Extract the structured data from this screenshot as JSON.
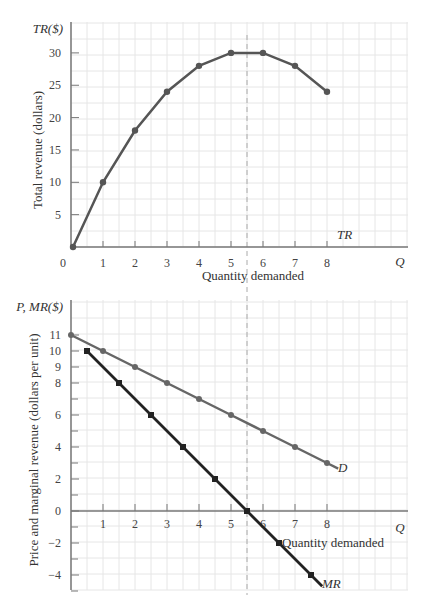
{
  "chart_data": [
    {
      "type": "line",
      "title": "",
      "ylabel": "Total revenue (dollars)",
      "y_axis_symbol": "TR($)",
      "xlabel": "Quantity demanded",
      "x_axis_symbol": "Q",
      "x": [
        0,
        1,
        2,
        3,
        4,
        5,
        6,
        7,
        8
      ],
      "series": [
        {
          "name": "TR",
          "values": [
            0,
            10,
            18,
            24,
            28,
            30,
            30,
            28,
            24
          ]
        }
      ],
      "x_ticks": [
        "0",
        "1",
        "2",
        "3",
        "4",
        "5",
        "6",
        "7",
        "8"
      ],
      "y_ticks": [
        "5",
        "10",
        "15",
        "20",
        "25",
        "30"
      ],
      "ylim": [
        0,
        34
      ],
      "xlim": [
        0,
        11
      ],
      "grid": true,
      "annotations": [
        {
          "type": "vertical-dashed-line",
          "x": 5.5
        }
      ]
    },
    {
      "type": "line",
      "title": "",
      "ylabel": "Price and marginal revenue (dollars per unit)",
      "y_axis_symbol": "P, MR($)",
      "xlabel": "Quantity demanded",
      "x_axis_symbol": "Q",
      "series": [
        {
          "name": "D",
          "x": [
            0,
            1,
            2,
            3,
            4,
            5,
            6,
            7,
            8
          ],
          "values": [
            11,
            10,
            9,
            8,
            7,
            6,
            5,
            4,
            3
          ]
        },
        {
          "name": "MR",
          "x": [
            0.5,
            1.5,
            2.5,
            3.5,
            4.5,
            5.5,
            6.5,
            7.5
          ],
          "values": [
            10,
            8,
            6,
            4,
            2,
            0,
            -2,
            -4
          ]
        }
      ],
      "x_ticks": [
        "1",
        "2",
        "3",
        "4",
        "5",
        "6",
        "7",
        "8"
      ],
      "y_ticks": [
        "11",
        "10",
        "9",
        "8",
        "6",
        "4",
        "2",
        "0",
        "-2",
        "-4"
      ],
      "ylim": [
        -5,
        13
      ],
      "xlim": [
        0,
        11
      ],
      "grid": true,
      "annotations": [
        {
          "type": "vertical-dashed-line",
          "x": 5.5
        }
      ]
    }
  ],
  "labels": {
    "top": {
      "y_symbol": "TR($)",
      "y_title": "Total revenue (dollars)",
      "x_title": "Quantity demanded",
      "x_symbol": "Q",
      "curve": "TR"
    },
    "bottom": {
      "y_symbol": "P, MR($)",
      "y_title": "Price and marginal revenue (dollars per unit)",
      "x_title": "Quantity demanded",
      "x_symbol": "Q",
      "curve_d": "D",
      "curve_mr": "MR"
    }
  },
  "colors": {
    "tr_line": "#555555",
    "d_line": "#666666",
    "mr_line": "#222222",
    "axis": "#777777",
    "grid": "#e6e6e6",
    "dashed": "#aaaaaa"
  }
}
